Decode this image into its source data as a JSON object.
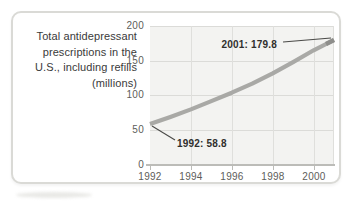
{
  "chart": {
    "title_display": "Total antidepressant\nprescriptions in the\nU.S., including refills\n(millions)"
  },
  "chart_data": {
    "type": "line",
    "title": "Total antidepressant prescriptions in the U.S., including refills (millions)",
    "x": [
      1992,
      1993,
      1994,
      1995,
      1996,
      1997,
      1998,
      1999,
      2000,
      2001
    ],
    "series": [
      {
        "name": "Total antidepressant prescriptions (millions)",
        "values": [
          58.8,
          69,
          80,
          92,
          104,
          117,
          132,
          148,
          165,
          179.8
        ]
      }
    ],
    "xlim": [
      1992,
      2001
    ],
    "ylim": [
      0,
      200
    ],
    "x_tick_labels": [
      "1992",
      "1994",
      "1996",
      "1998",
      "2000"
    ],
    "y_tick_labels": [
      "200",
      "150",
      "100",
      "50",
      "0"
    ],
    "grid": true,
    "legend": "none",
    "line_color": "#a9a9a6",
    "annotations": [
      {
        "text": "1992: 58.8",
        "x": 1992,
        "y": 58.8
      },
      {
        "text": "2001: 179.8",
        "x": 2001,
        "y": 179.8
      }
    ]
  },
  "colors": {
    "line": "#a9a9a6",
    "line_tip": "#8e8e8b",
    "grid": "#dbdbd8",
    "plot_background": "#f3f3f1",
    "axis": "#bcbcb8",
    "card_border": "#dadad6",
    "text": "#3a3a3a",
    "annotation_text": "#2f2f2d"
  }
}
